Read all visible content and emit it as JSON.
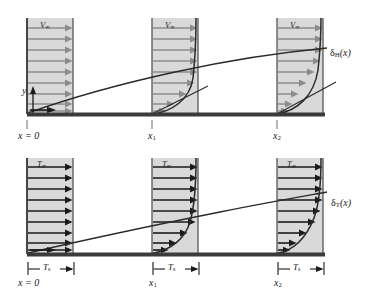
{
  "figure": {
    "type": "technical-diagram",
    "panels": [
      {
        "id": "hydrodynamic",
        "name": "velocity-boundary-layer",
        "freestream_label": "V",
        "freestream_sub": "∞",
        "thickness_label": "δ",
        "thickness_sub": "H",
        "thickness_arg": "(x)",
        "vertical_axis_label": "y",
        "station_labels": [
          "x = 0",
          "x",
          "x"
        ],
        "station_subs": [
          "",
          "1",
          "2"
        ],
        "arrow_color": "#8c8c8c",
        "fill_color": "#d9d9d9",
        "profile_curvature": "convex-right"
      },
      {
        "id": "thermal",
        "name": "thermal-boundary-layer",
        "freestream_label": "T",
        "freestream_sub": "∞",
        "thickness_label": "δ",
        "thickness_sub": "T",
        "thickness_arg": "(x)",
        "surface_temp_label": "T",
        "surface_temp_sub": "s",
        "station_labels": [
          "x = 0",
          "x",
          "x"
        ],
        "station_subs": [
          "",
          "1",
          "2"
        ],
        "arrow_color": "#1a1a1a",
        "fill_color": "#d9d9d9",
        "profile_curvature": "concave-right"
      }
    ],
    "colors": {
      "plate": "#3b3b3b",
      "fill": "#d9d9d9",
      "gray_arrow": "#8c8c8c",
      "black_arrow": "#1a1a1a",
      "curve": "#2a2a2a",
      "box_border": "#555555",
      "tick": "#7a7a7a",
      "text": "#1a1a1a"
    },
    "geometry": {
      "station_x": [
        27,
        152,
        277
      ],
      "box_width": 46,
      "top_plate_y": 114,
      "top_box_top": 18,
      "bottom_plate_y": 254,
      "bottom_box_top": 158,
      "plate_left": 27,
      "plate_right": 325,
      "n_arrows_top": 9,
      "n_arrows_bottom": 9
    }
  }
}
